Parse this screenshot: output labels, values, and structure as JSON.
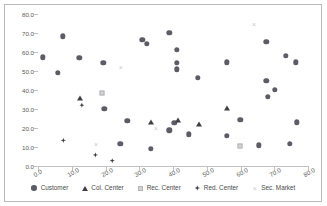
{
  "chart_data": {
    "type": "scatter",
    "title": "",
    "xlabel": "",
    "ylabel": "",
    "xlim": [
      0,
      80
    ],
    "ylim": [
      0,
      80
    ],
    "grid": false,
    "legend_position": "bottom",
    "xticks": [
      "0.0",
      "10.0",
      "20.0",
      "30.0",
      "40.0",
      "50.0",
      "60.0",
      "70.0",
      "80.0"
    ],
    "yticks": [
      "0.0",
      "10.0",
      "20.0",
      "30.0",
      "40.0",
      "50.0",
      "60.0",
      "70.0",
      "80.0"
    ],
    "series": [
      {
        "name": "Customer",
        "marker": "circle",
        "color": "#5c5c66",
        "points": [
          [
            1.5,
            57.2
          ],
          [
            5.8,
            49.0
          ],
          [
            7.4,
            68.2
          ],
          [
            12.2,
            56.8
          ],
          [
            19.3,
            54.3
          ],
          [
            19.6,
            30.0
          ],
          [
            24.4,
            11.8
          ],
          [
            26.5,
            23.9
          ],
          [
            30.9,
            66.4
          ],
          [
            32.2,
            64.2
          ],
          [
            33.4,
            9.2
          ],
          [
            38.9,
            70.0
          ],
          [
            38.9,
            18.7
          ],
          [
            40.4,
            22.6
          ],
          [
            41.1,
            61.0
          ],
          [
            41.2,
            54.3
          ],
          [
            41.1,
            50.8
          ],
          [
            44.7,
            16.7
          ],
          [
            47.4,
            46.5
          ],
          [
            55.9,
            54.6
          ],
          [
            56.0,
            16.0
          ],
          [
            59.9,
            24.2
          ],
          [
            65.5,
            10.8
          ],
          [
            67.6,
            65.4
          ],
          [
            67.7,
            45.0
          ],
          [
            68.0,
            36.5
          ],
          [
            70.2,
            40.0
          ],
          [
            73.4,
            58.0
          ],
          [
            74.6,
            11.8
          ],
          [
            76.3,
            54.6
          ],
          [
            76.6,
            23.1
          ]
        ]
      },
      {
        "name": "Col. Center",
        "marker": "triangle",
        "color": "#3f3f46",
        "points": [
          [
            12.3,
            36.0
          ],
          [
            33.4,
            23.3
          ],
          [
            41.5,
            24.0
          ],
          [
            47.6,
            22.2
          ],
          [
            56.1,
            30.5
          ]
        ]
      },
      {
        "name": "Rec. Center",
        "marker": "square",
        "color": "#d3d3d6",
        "points": [
          [
            18.9,
            38.6
          ],
          [
            59.9,
            10.6
          ]
        ]
      },
      {
        "name": "Red. Center",
        "marker": "diamond",
        "color": "#3a3a40",
        "points": [
          [
            7.5,
            13.5
          ],
          [
            13.0,
            32.0
          ],
          [
            17.0,
            5.8
          ],
          [
            22.0,
            2.8
          ]
        ]
      },
      {
        "name": "Sec. Market",
        "marker": "cross",
        "color": "#c8c8cc",
        "symbol": "×",
        "points": [
          [
            17.2,
            11.8
          ],
          [
            24.5,
            52.3
          ],
          [
            35.0,
            20.0
          ],
          [
            64.0,
            75.0
          ]
        ]
      }
    ]
  },
  "legend": {
    "items": [
      {
        "label": "Customer",
        "marker": "circle"
      },
      {
        "label": "Col. Center",
        "marker": "triangle"
      },
      {
        "label": "Rec. Center",
        "marker": "square"
      },
      {
        "label": "Red. Center",
        "marker": "diamond"
      },
      {
        "label": "Sec. Market",
        "marker": "cross"
      }
    ]
  }
}
